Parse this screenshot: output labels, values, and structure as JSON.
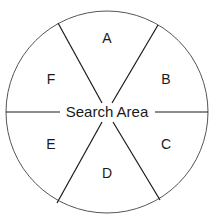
{
  "diagram": {
    "title": "Search Area",
    "center_label": "Search Area",
    "sectors": [
      {
        "id": "A",
        "label": "A",
        "x": 107,
        "y": 43
      },
      {
        "id": "B",
        "label": "B",
        "x": 166,
        "y": 84
      },
      {
        "id": "C",
        "label": "C",
        "x": 166,
        "y": 149
      },
      {
        "id": "D",
        "label": "D",
        "x": 107,
        "y": 178
      },
      {
        "id": "E",
        "label": "E",
        "x": 51,
        "y": 149
      },
      {
        "id": "F",
        "label": "F",
        "x": 51,
        "y": 84
      }
    ],
    "colors": {
      "stroke": "#1a1a1a",
      "circle_stroke": "#555555",
      "background": "#ffffff"
    }
  }
}
